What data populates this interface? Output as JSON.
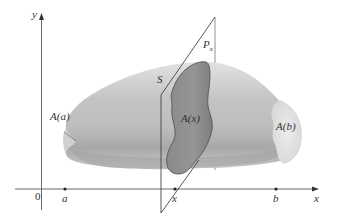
{
  "figure": {
    "type": "solid-of-volume-cross-section",
    "axes": {
      "x_label": "x",
      "y_label": "y",
      "origin_label": "0",
      "ticks": [
        {
          "label": "a",
          "role": "left-endpoint"
        },
        {
          "label": "x",
          "role": "cross-section-position"
        },
        {
          "label": "b",
          "role": "right-endpoint"
        }
      ]
    },
    "labels": {
      "solid": "S",
      "plane_main": "P",
      "plane_sub": "x",
      "area_a": "A(a)",
      "area_x": "A(x)",
      "area_b": "A(b)"
    },
    "colors": {
      "solid_light": "#d9d9d9",
      "solid_mid": "#b5b5b5",
      "solid_dark": "#9a9a9a",
      "cross_section": "#8c8c8c",
      "end_cap": "#e6e6e6",
      "lines": "#555555"
    }
  }
}
